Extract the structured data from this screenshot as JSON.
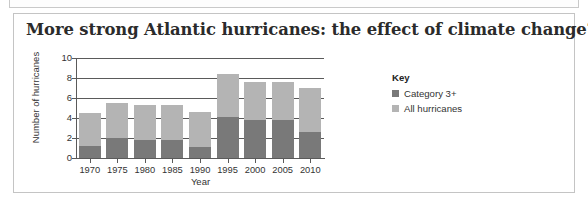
{
  "card": {
    "title": "More strong Atlantic hurricanes: the effect of climate change?"
  },
  "legend": {
    "title": "Key",
    "items": [
      {
        "label": "Category 3+",
        "color": "#797979"
      },
      {
        "label": "All hurricanes",
        "color": "#b4b4b4"
      }
    ]
  },
  "axes": {
    "ylabel": "Number of hurricanes",
    "xlabel": "Year",
    "yticks": [
      "10",
      "8",
      "6",
      "4",
      "2",
      "0"
    ]
  },
  "chart_data": {
    "type": "bar",
    "title": "More strong Atlantic hurricanes: the effect of climate change?",
    "xlabel": "Year",
    "ylabel": "Number of hurricanes",
    "ylim": [
      0,
      10
    ],
    "yticks": [
      0,
      2,
      4,
      6,
      8,
      10
    ],
    "grid": true,
    "legend_position": "right",
    "stacked": false,
    "overlaid": true,
    "categories": [
      "1970",
      "1975",
      "1980",
      "1985",
      "1990",
      "1995",
      "2000",
      "2005",
      "2010"
    ],
    "series": [
      {
        "name": "All hurricanes",
        "color": "#b4b4b4",
        "values": [
          4.5,
          5.5,
          5.3,
          5.3,
          4.6,
          8.4,
          7.6,
          7.6,
          7.0
        ]
      },
      {
        "name": "Category 3+",
        "color": "#797979",
        "values": [
          1.2,
          2.0,
          1.8,
          1.85,
          1.1,
          4.15,
          3.85,
          3.8,
          2.65
        ]
      }
    ]
  }
}
